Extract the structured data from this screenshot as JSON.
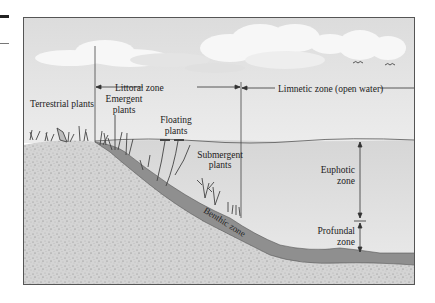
{
  "diagram": {
    "zones": {
      "littoral": "Littoral zone",
      "limnetic": "Limnetic zone (open water)",
      "euphotic_line1": "Euphotic",
      "euphotic_line2": "zone",
      "profundal_line1": "Profundal",
      "profundal_line2": "zone",
      "benthic": "Benthic zone"
    },
    "plants": {
      "terrestrial": "Terrestrial plants",
      "emergent_line1": "Emergent",
      "emergent_line2": "plants",
      "floating_line1": "Floating",
      "floating_line2": "plants",
      "submergent_line1": "Submergent",
      "submergent_line2": "plants"
    },
    "colors": {
      "sky": "#e4e4e4",
      "water": "#dcdcdc",
      "sediment": "#8f8f8f",
      "soil": "#d0d0d0",
      "frame": "#555555"
    }
  }
}
